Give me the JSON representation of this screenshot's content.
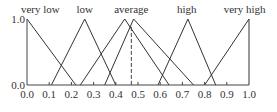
{
  "chart_data": {
    "type": "line",
    "title": "",
    "xlabel": "",
    "ylabel": "",
    "xlim": [
      0.0,
      1.0
    ],
    "ylim": [
      0.0,
      1.0
    ],
    "grid": false,
    "x_ticks": [
      "0.0",
      "0.1",
      "0.2",
      "0.3",
      "0.4",
      "0.5",
      "0.6",
      "0.7",
      "0.8",
      "0.9",
      "1.0"
    ],
    "x_tick_values": [
      0.0,
      0.1,
      0.2,
      0.3,
      0.4,
      0.5,
      0.6,
      0.7,
      0.8,
      0.9,
      1.0
    ],
    "y_ticks": [
      "0.0",
      "1.0"
    ],
    "y_tick_values": [
      0.0,
      1.0
    ],
    "series": [
      {
        "name": "very low",
        "label_x": 0.06,
        "points": [
          [
            0.0,
            1.0
          ],
          [
            0.22,
            0.0
          ]
        ]
      },
      {
        "name": "low",
        "label_x": 0.26,
        "points": [
          [
            0.11,
            0.0
          ],
          [
            0.26,
            1.0
          ],
          [
            0.4,
            0.0
          ]
        ]
      },
      {
        "name": "average",
        "label_x": 0.47,
        "points": [
          [
            0.24,
            0.0
          ],
          [
            0.44,
            1.0
          ],
          [
            0.64,
            0.0
          ]
        ]
      },
      {
        "name": "",
        "points": [
          [
            0.35,
            0.0
          ],
          [
            0.48,
            1.0
          ],
          [
            0.75,
            0.0
          ]
        ]
      },
      {
        "name": "high",
        "label_x": 0.72,
        "points": [
          [
            0.59,
            0.0
          ],
          [
            0.725,
            1.0
          ],
          [
            0.85,
            0.0
          ]
        ]
      },
      {
        "name": "very high",
        "label_x": 0.98,
        "points": [
          [
            0.8,
            0.0
          ],
          [
            1.0,
            1.0
          ],
          [
            1.0,
            0.0
          ]
        ]
      }
    ],
    "reference_line": {
      "x": 0.47,
      "y_top": 0.88,
      "style": "dashed"
    }
  }
}
